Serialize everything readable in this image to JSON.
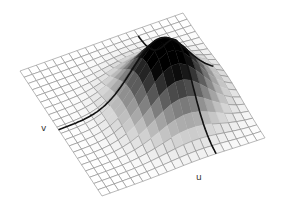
{
  "figure": {
    "grid_cells": 20,
    "labels": {
      "v": "v",
      "u": "u"
    },
    "colors": {
      "grid": "#8a8a8a",
      "curve": "#111111",
      "peak": "#000000",
      "background": "#ffffff"
    }
  },
  "chart_data": {
    "type": "surface",
    "title": "",
    "axes": [
      "u",
      "v"
    ],
    "grid_resolution": [
      20,
      20
    ],
    "surface": "gaussian bump",
    "peak_location_uv": [
      0.55,
      0.62
    ],
    "sigma": 0.17,
    "highlighted_curves": [
      "v-slice through peak",
      "u-slice through peak"
    ]
  }
}
